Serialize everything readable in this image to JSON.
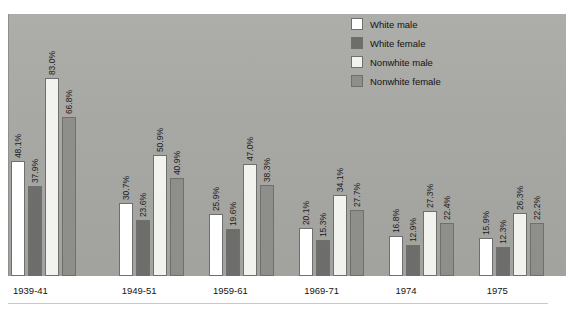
{
  "figure": {
    "cropped_title_fragment": "",
    "panel_color": "#a9a9a6",
    "background_color": "#ffffff"
  },
  "legend": {
    "position": "top-right",
    "items": [
      {
        "label": "White male",
        "color": "#ffffff",
        "swatch_name": "legend-swatch-white-male"
      },
      {
        "label": "White female",
        "color": "#6d6d6b",
        "swatch_name": "legend-swatch-white-female"
      },
      {
        "label": "Nonwhite male",
        "color": "#f2f2ee",
        "swatch_name": "legend-swatch-nonwhite-male"
      },
      {
        "label": "Nonwhite female",
        "color": "#8e8e8b",
        "swatch_name": "legend-swatch-nonwhite-female"
      }
    ]
  },
  "chart_data": {
    "type": "bar",
    "title": "",
    "xlabel": "",
    "ylabel": "",
    "ylim": [
      0,
      100
    ],
    "grid": false,
    "legend_position": "top-right",
    "categories": [
      "1939-41",
      "1949-51",
      "1959-61",
      "1969-71",
      "1974",
      "1975"
    ],
    "series": [
      {
        "name": "White male",
        "color": "#ffffff",
        "values": [
          48.1,
          30.7,
          25.9,
          20.1,
          16.8,
          15.9
        ],
        "labels": [
          "48.1%",
          "30.7%",
          "25.9%",
          "20.1%",
          "16.8%",
          "15.9%"
        ]
      },
      {
        "name": "White female",
        "color": "#6d6d6b",
        "values": [
          37.9,
          23.6,
          19.6,
          15.3,
          12.9,
          12.3
        ],
        "labels": [
          "37.9%",
          "23.6%",
          "19.6%",
          "15.3%",
          "12.9%",
          "12.3%"
        ]
      },
      {
        "name": "Nonwhite male",
        "color": "#f2f2ee",
        "values": [
          83.0,
          50.9,
          47.0,
          34.1,
          27.3,
          26.3
        ],
        "labels": [
          "83.0%",
          "50.9%",
          "47.0%",
          "34.1%",
          "27.3%",
          "26.3%"
        ]
      },
      {
        "name": "Nonwhite female",
        "color": "#8e8e8b",
        "values": [
          66.8,
          40.9,
          38.3,
          27.7,
          22.4,
          22.2
        ],
        "labels": [
          "66.8%",
          "40.9%",
          "38.3%",
          "27.7%",
          "22.4%",
          "22.2%"
        ]
      }
    ]
  },
  "axis": {
    "tick_labels": [
      "1939-41",
      "1949-51",
      "1959-61",
      "1969-71",
      "1974",
      "1975"
    ]
  }
}
